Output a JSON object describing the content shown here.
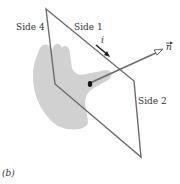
{
  "figure": {
    "panel_label": "(b)",
    "labels": {
      "side1": "Side 1",
      "side2": "Side 2",
      "side4": "Side 4",
      "current": "i",
      "normal": "n"
    },
    "colors": {
      "frame": "#6b6b6b",
      "hand": "#c9c9c9",
      "arrow": "#6b6b6b",
      "dot": "#111111",
      "text": "#333333"
    }
  }
}
